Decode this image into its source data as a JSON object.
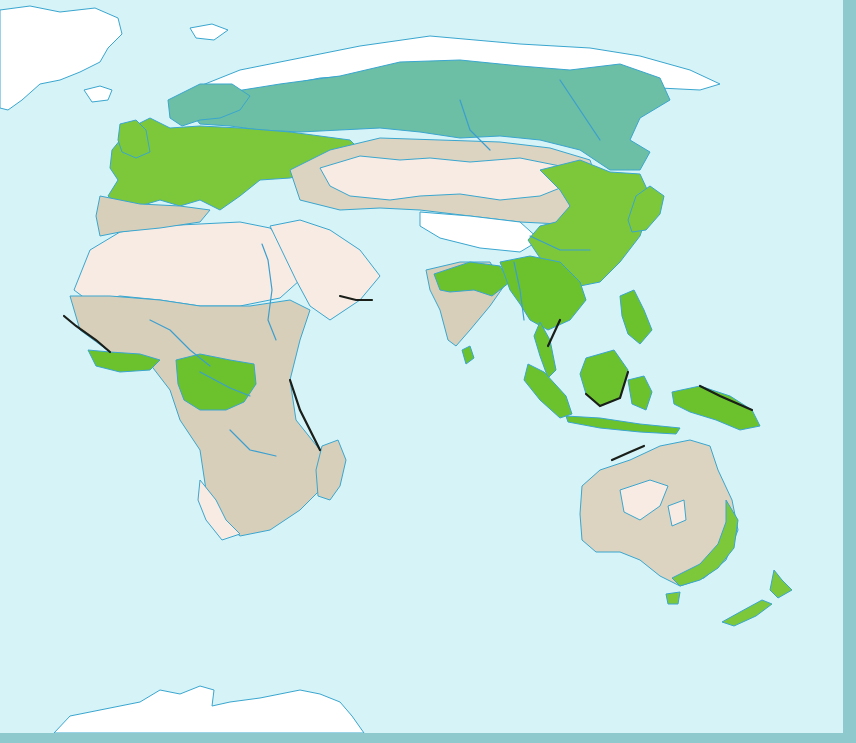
{
  "map": {
    "title": "",
    "projection": "Eastern Hemisphere world map (no labels)",
    "colors": {
      "ocean": "#d6f3f7",
      "frame": "#8ec9cd",
      "coastline": "#3aa6cf",
      "river": "#3a9fd0",
      "ice": "#ffffff",
      "desert": "#f7ebe4",
      "steppe_grassland": "#dcd4c0",
      "savanna": "#d8cfba",
      "temperate_forest": "#7cc83a",
      "tropical_forest": "#6cc22c",
      "boreal_forest": "#6cbfa4",
      "mangrove_coast": "#1a1f1a"
    },
    "legend": [
      {
        "key": "ice",
        "label": "Ice sheet / tundra"
      },
      {
        "key": "desert",
        "label": "Desert"
      },
      {
        "key": "steppe_grassland",
        "label": "Grassland / steppe"
      },
      {
        "key": "savanna",
        "label": "Savanna (patterned)"
      },
      {
        "key": "temperate_forest",
        "label": "Temperate forest"
      },
      {
        "key": "tropical_forest",
        "label": "Tropical rainforest"
      },
      {
        "key": "boreal_forest",
        "label": "Boreal forest (taiga)"
      },
      {
        "key": "mangrove_coast",
        "label": "Mangrove coast"
      }
    ],
    "regions": [
      {
        "name": "greenland",
        "fill": "ice",
        "d": "M0,10 L30,6 L60,12 L95,8 L118,18 L122,34 L108,48 L100,62 L80,72 L60,80 L40,84 L22,100 L8,110 L0,108 Z"
      },
      {
        "name": "iceland",
        "fill": "ice",
        "d": "M84,90 L100,86 L112,90 L108,100 L92,102 Z"
      },
      {
        "name": "svalbard",
        "fill": "ice",
        "d": "M190,28 L212,24 L228,30 L214,40 L196,38 Z"
      },
      {
        "name": "arctic-tundra",
        "fill": "ice",
        "d": "M170,110 L200,86 L240,70 L300,58 L360,46 L430,36 L520,44 L590,48 L640,56 L690,70 L720,84 L700,90 L660,88 L620,94 L560,90 L500,80 L440,72 L380,74 L320,78 L280,86 L240,98 L200,110 Z"
      },
      {
        "name": "boreal-taiga",
        "fill": "boreal_forest",
        "d": "M190,112 L230,92 L280,84 L340,76 L400,62 L460,60 L520,66 L570,70 L620,64 L660,78 L670,100 L640,118 L630,140 L650,152 L640,170 L610,170 L580,150 L540,140 L500,136 L460,138 L420,132 L380,128 L340,130 L300,132 L260,130 L230,126 L200,124 Z"
      },
      {
        "name": "europe-temperate",
        "fill": "temperate_forest",
        "d": "M112,150 L130,128 L150,118 L170,128 L200,126 L240,128 L290,132 L320,136 L350,140 L360,150 L320,170 L290,178 L260,180 L240,196 L220,210 L200,200 L180,206 L160,200 L140,206 L120,206 L108,196 L118,180 L110,168 Z"
      },
      {
        "name": "british-isles",
        "fill": "temperate_forest",
        "d": "M120,124 L136,120 L146,130 L150,152 L136,158 L122,152 L118,140 Z"
      },
      {
        "name": "scandinavia",
        "fill": "boreal_forest",
        "d": "M168,100 L200,84 L232,84 L250,96 L240,110 L220,118 L200,120 L182,126 L170,118 Z"
      },
      {
        "name": "central-asia-steppe",
        "fill": "steppe_grassland",
        "d": "M290,170 L330,150 L380,138 L440,140 L500,142 L550,148 L590,160 L600,190 L580,214 L560,224 L520,222 L470,216 L420,210 L380,208 L340,210 L300,200 Z"
      },
      {
        "name": "central-asia-desert",
        "fill": "desert",
        "d": "M320,168 L360,156 L400,160 L430,158 L470,162 L520,158 L560,166 L570,184 L540,196 L500,200 L460,194 L420,196 L390,200 L350,196 L330,186 Z"
      },
      {
        "name": "tibet",
        "fill": "ice",
        "d": "M420,212 L470,216 L520,222 L540,240 L520,252 L480,248 L440,238 L420,226 Z"
      },
      {
        "name": "east-asia-forest",
        "fill": "temperate_forest",
        "d": "M540,170 L580,160 L610,172 L640,174 L652,200 L640,236 L620,262 L600,282 L580,286 L560,270 L540,258 L528,240 L540,226 L556,222 L570,206 L560,190 Z"
      },
      {
        "name": "japan",
        "fill": "temperate_forest",
        "d": "M636,196 L650,186 L664,196 L660,214 L646,230 L632,232 L628,220 Z"
      },
      {
        "name": "north-africa-sahara",
        "fill": "desert",
        "d": "M74,290 L90,250 L120,232 L160,226 L200,224 L240,222 L270,228 L290,250 L300,280 L280,298 L240,306 L200,306 L160,300 L120,296 L90,302 Z"
      },
      {
        "name": "arabia",
        "fill": "desert",
        "d": "M270,226 L300,220 L330,230 L360,250 L380,276 L360,300 L330,320 L310,306 L296,280 Z"
      },
      {
        "name": "mediterranean-scrub",
        "fill": "savanna",
        "d": "M100,196 L140,204 L180,206 L210,210 L200,222 L160,228 L120,232 L100,236 L96,216 Z"
      },
      {
        "name": "sahel-savanna",
        "fill": "savanna",
        "d": "M70,296 L110,296 L160,300 L200,306 L250,306 L290,300 L310,310 L300,340 L290,380 L296,420 L320,450 L330,480 L300,510 L270,530 L240,536 L220,520 L206,490 L200,450 L180,420 L170,390 L150,364 L110,352 L80,330 Z"
      },
      {
        "name": "central-africa-rainforest",
        "fill": "tropical_forest",
        "d": "M176,360 L200,354 L230,360 L254,364 L256,384 L244,402 L226,410 L200,410 L184,400 L178,384 Z"
      },
      {
        "name": "west-africa-forest",
        "fill": "tropical_forest",
        "d": "M88,350 L110,352 L140,354 L160,360 L150,370 L120,372 L96,366 Z"
      },
      {
        "name": "kalahari-desert",
        "fill": "desert",
        "d": "M200,480 L216,500 L226,520 L240,534 L222,540 L206,520 L198,500 Z"
      },
      {
        "name": "madagascar",
        "fill": "savanna",
        "d": "M322,446 L338,440 L346,460 L340,486 L330,500 L318,496 L316,470 Z"
      },
      {
        "name": "india",
        "fill": "savanna",
        "d": "M426,270 L460,262 L490,262 L504,286 L490,306 L470,330 L456,346 L448,340 L440,310 L430,290 Z"
      },
      {
        "name": "india-forest",
        "fill": "tropical_forest",
        "d": "M434,274 L470,262 L500,266 L510,282 L492,296 L474,290 L450,292 L440,290 Z"
      },
      {
        "name": "sri-lanka",
        "fill": "tropical_forest",
        "d": "M462,350 L470,346 L474,358 L466,364 Z"
      },
      {
        "name": "southeast-asia",
        "fill": "tropical_forest",
        "d": "M500,262 L530,256 L560,262 L580,282 L586,300 L570,320 L548,330 L530,320 L520,304 L510,290 Z"
      },
      {
        "name": "malay-peninsula",
        "fill": "tropical_forest",
        "d": "M540,322 L550,340 L556,370 L548,378 L540,356 L534,336 Z"
      },
      {
        "name": "sumatra",
        "fill": "tropical_forest",
        "d": "M528,364 L544,372 L566,396 L572,414 L560,418 L540,400 L524,380 Z"
      },
      {
        "name": "borneo",
        "fill": "tropical_forest",
        "d": "M586,358 L614,350 L628,370 L620,398 L600,406 L586,394 L580,374 Z"
      },
      {
        "name": "philippines",
        "fill": "tropical_forest",
        "d": "M620,296 L634,290 L644,310 L652,330 L640,344 L628,334 L622,316 Z"
      },
      {
        "name": "sulawesi-moluccas",
        "fill": "tropical_forest",
        "d": "M628,380 L644,376 L652,392 L646,410 L632,404 Z"
      },
      {
        "name": "java-lesser-sunda",
        "fill": "tropical_forest",
        "d": "M566,416 L600,418 L640,424 L680,428 L676,434 L640,432 L600,428 L568,422 Z"
      },
      {
        "name": "new-guinea",
        "fill": "tropical_forest",
        "d": "M672,392 L700,386 L730,396 L752,410 L760,426 L740,430 L716,420 L690,412 L674,404 Z"
      },
      {
        "name": "australia",
        "fill": "steppe_grassland",
        "d": "M582,486 L600,470 L630,460 L660,446 L690,440 L710,446 L718,470 L732,500 L738,530 L726,560 L704,578 L680,586 L660,576 L640,560 L620,552 L596,552 L582,540 L580,514 Z"
      },
      {
        "name": "australia-desert-1",
        "fill": "desert",
        "d": "M620,490 L650,480 L668,486 L660,506 L640,520 L624,512 Z"
      },
      {
        "name": "australia-desert-2",
        "fill": "desert",
        "d": "M668,506 L684,500 L686,520 L672,526 Z"
      },
      {
        "name": "australia-east-forest",
        "fill": "temperate_forest",
        "d": "M726,500 L738,520 L734,548 L718,568 L700,580 L680,586 L672,578 L700,564 L718,544 L726,522 Z"
      },
      {
        "name": "tasmania",
        "fill": "temperate_forest",
        "d": "M666,594 L680,592 L678,604 L668,604 Z"
      },
      {
        "name": "new-zealand-north",
        "fill": "temperate_forest",
        "d": "M774,570 L782,580 L792,590 L778,598 L770,590 Z"
      },
      {
        "name": "new-zealand-south",
        "fill": "temperate_forest",
        "d": "M722,622 L740,612 L762,600 L772,604 L756,616 L734,626 Z"
      },
      {
        "name": "antarctica",
        "fill": "ice",
        "d": "M54,733 L70,716 L110,708 L140,702 L160,690 L180,694 L200,686 L214,690 L212,706 L230,702 L260,698 L280,694 L300,690 L320,694 L340,702 L352,716 L364,733 Z"
      }
    ],
    "rivers": [
      "M262,244 L268,260 L272,290 L268,320 L276,340",
      "M40,0 M150,320 L170,330 L190,350 L210,366",
      "M200,372 L230,388 L250,396",
      "M230,430 L250,450 L276,456",
      "M460,100 L470,130 L490,150",
      "M560,80 L580,110 L600,140",
      "M530,236 L560,250 L590,250",
      "M514,262 L520,290 L524,320"
    ],
    "dark_coasts": [
      "M64,316 L76,326 L96,340 L110,352",
      "M290,380 L300,410 L320,450",
      "M586,394 L600,406 L620,398 L628,372",
      "M700,386 L720,396 L752,410",
      "M612,460 L630,452 L644,446",
      "M340,296 L356,300 L372,300",
      "M560,320 L548,346"
    ]
  }
}
